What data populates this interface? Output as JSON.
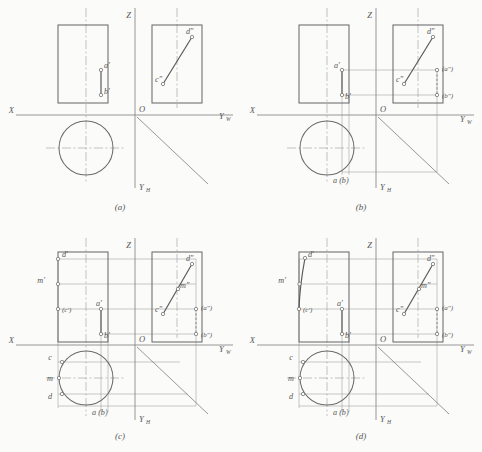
{
  "figure": {
    "background": "#fbfbfa",
    "line_color": "#6b6b6b",
    "thin_line_color": "#9a9a9a"
  },
  "axes": {
    "x": "X",
    "z": "Z",
    "origin": "O",
    "y_w_base": "Y",
    "y_w_sub": "W",
    "y_h_base": "Y",
    "y_h_sub": "H"
  },
  "panels": [
    {
      "id": "a",
      "caption": "(a)",
      "labels": [
        {
          "name": "a-prime",
          "text": "a′"
        },
        {
          "name": "b-prime",
          "text": "b′"
        },
        {
          "name": "c-double-prime",
          "text": "c″"
        },
        {
          "name": "d-double-prime",
          "text": "d″"
        }
      ]
    },
    {
      "id": "b",
      "caption": "(b)",
      "labels": [
        {
          "name": "a-prime",
          "text": "a′"
        },
        {
          "name": "b-prime",
          "text": "b′"
        },
        {
          "name": "c-double-prime",
          "text": "c″"
        },
        {
          "name": "d-double-prime",
          "text": "d″"
        },
        {
          "name": "a-double-prime-hidden",
          "text": "(a″)"
        },
        {
          "name": "b-double-prime-hidden",
          "text": "(b″)"
        },
        {
          "name": "a-b-top-view",
          "text": "a (b)"
        }
      ]
    },
    {
      "id": "c",
      "caption": "(c)",
      "labels": [
        {
          "name": "d-prime",
          "text": "d′"
        },
        {
          "name": "m-prime",
          "text": "m′"
        },
        {
          "name": "c-prime-hidden",
          "text": "(c′)"
        },
        {
          "name": "a-prime",
          "text": "a′"
        },
        {
          "name": "b-prime",
          "text": "b′"
        },
        {
          "name": "c-double-prime",
          "text": "c″"
        },
        {
          "name": "d-double-prime",
          "text": "d″"
        },
        {
          "name": "m-double-prime",
          "text": "m″"
        },
        {
          "name": "a-double-prime-hidden",
          "text": "(a″)"
        },
        {
          "name": "b-double-prime-hidden",
          "text": "(b″)"
        },
        {
          "name": "c-top-view",
          "text": "c"
        },
        {
          "name": "m-top-view",
          "text": "m"
        },
        {
          "name": "d-top-view",
          "text": "d"
        },
        {
          "name": "a-b-top-view",
          "text": "a (b)"
        }
      ]
    },
    {
      "id": "d",
      "caption": "(d)",
      "labels": [
        {
          "name": "d-prime",
          "text": "d′"
        },
        {
          "name": "m-prime",
          "text": "m′"
        },
        {
          "name": "c-prime-hidden",
          "text": "(c′)"
        },
        {
          "name": "a-prime",
          "text": "a′"
        },
        {
          "name": "b-prime",
          "text": "b′"
        },
        {
          "name": "c-double-prime",
          "text": "c″"
        },
        {
          "name": "d-double-prime",
          "text": "d″"
        },
        {
          "name": "m-double-prime",
          "text": "m″"
        },
        {
          "name": "a-double-prime-hidden",
          "text": "(a″)"
        },
        {
          "name": "b-double-prime-hidden",
          "text": "(b″)"
        },
        {
          "name": "c-top-view",
          "text": "c"
        },
        {
          "name": "m-top-view",
          "text": "m"
        },
        {
          "name": "d-top-view",
          "text": "d"
        },
        {
          "name": "a-b-top-view",
          "text": "a (b)"
        }
      ]
    }
  ]
}
